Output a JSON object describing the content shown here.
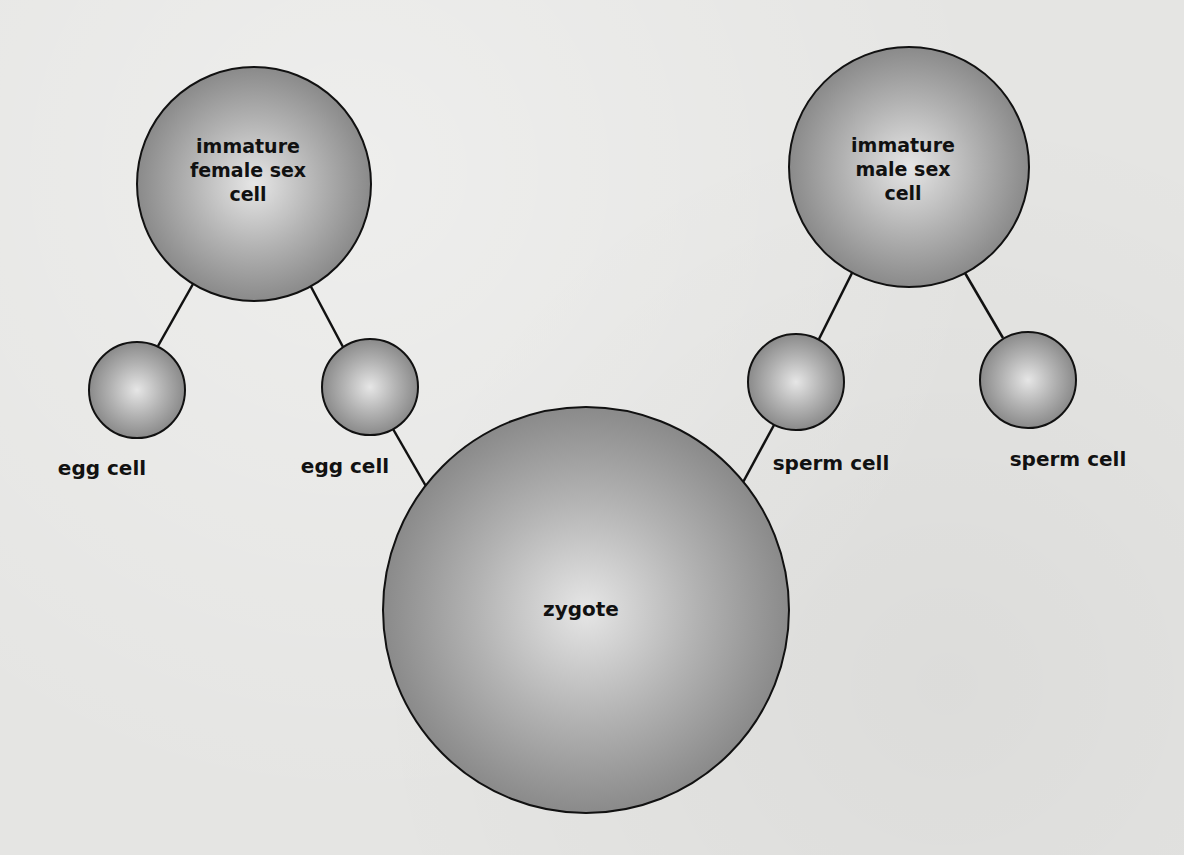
{
  "diagram": {
    "type": "tree",
    "colors": {
      "background": "#e5e5e3",
      "cell_fill_center": "#e4e4e4",
      "cell_fill_edge": "#8d8d8d",
      "outline": "#111111",
      "text": "#111111"
    },
    "nodes": {
      "female_parent": {
        "label": "immature\nfemale sex\ncell",
        "cx": 254,
        "cy": 184,
        "r": 117
      },
      "male_parent": {
        "label": "immature\nmale sex\ncell",
        "cx": 909,
        "cy": 167,
        "r": 120
      },
      "egg_1": {
        "label": "egg cell",
        "cx": 137,
        "cy": 390,
        "r": 48,
        "label_x": 102,
        "label_y": 468
      },
      "egg_2": {
        "label": "egg cell",
        "cx": 370,
        "cy": 387,
        "r": 48,
        "label_x": 345,
        "label_y": 466
      },
      "sperm_1": {
        "label": "sperm cell",
        "cx": 796,
        "cy": 382,
        "r": 48,
        "label_x": 831,
        "label_y": 463
      },
      "sperm_2": {
        "label": "sperm cell",
        "cx": 1028,
        "cy": 380,
        "r": 48,
        "label_x": 1068,
        "label_y": 459
      },
      "zygote": {
        "label": "zygote",
        "cx": 586,
        "cy": 610,
        "r": 203
      }
    },
    "edges": [
      {
        "from": "female_parent",
        "to": "egg_1"
      },
      {
        "from": "female_parent",
        "to": "egg_2"
      },
      {
        "from": "male_parent",
        "to": "sperm_1"
      },
      {
        "from": "male_parent",
        "to": "sperm_2"
      },
      {
        "from": "egg_2",
        "to": "zygote"
      },
      {
        "from": "sperm_1",
        "to": "zygote"
      }
    ]
  }
}
